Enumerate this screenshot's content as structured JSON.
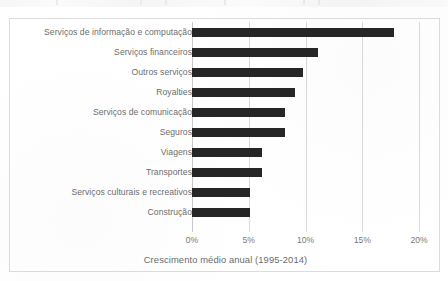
{
  "chart_data": {
    "type": "bar",
    "orientation": "horizontal",
    "title": "",
    "xlabel": "Crescimento médio anual (1995-2014)",
    "ylabel": "",
    "xlim": [
      0,
      20
    ],
    "xticks": [
      0,
      5,
      10,
      15,
      20
    ],
    "xtick_labels": [
      "0%",
      "5%",
      "10%",
      "15%",
      "20%"
    ],
    "grid": "vertical",
    "legend": "none",
    "bar_color": "#262626",
    "gridline_color": "#d9d9d9",
    "categories": [
      "Serviços de informação e computação",
      "Serviços financeiros",
      "Outros serviços",
      "Royalties",
      "Serviços de comunicação",
      "Seguros",
      "Viagens",
      "Transportes",
      "Serviços culturais e recreativos",
      "Construção"
    ],
    "values": [
      17.8,
      11.1,
      9.8,
      9.1,
      8.2,
      8.2,
      6.2,
      6.2,
      5.1,
      5.1
    ]
  }
}
